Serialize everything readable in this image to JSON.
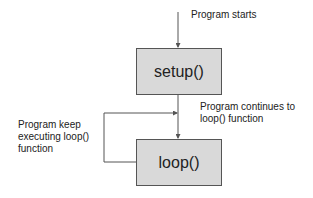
{
  "diagram": {
    "nodes": [
      {
        "id": "setup",
        "label": "setup()"
      },
      {
        "id": "loop",
        "label": "loop()"
      }
    ],
    "annotations": {
      "start": "Program starts",
      "continues_line1": "Program continues to",
      "continues_line2": "loop() function",
      "keep_line1": "Program keep",
      "keep_line2": "executing loop()",
      "keep_line3": "function"
    },
    "edges": [
      {
        "from": "start",
        "to": "setup"
      },
      {
        "from": "setup",
        "to": "loop"
      },
      {
        "from": "loop",
        "to": "loop"
      }
    ],
    "colors": {
      "box_fill": "#d9d9d9",
      "stroke": "#555555"
    }
  }
}
